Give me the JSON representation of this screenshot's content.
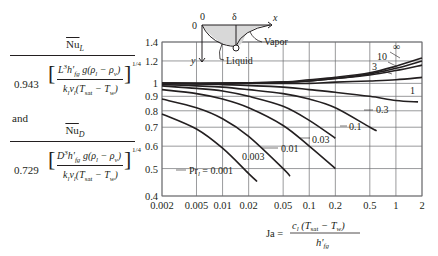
{
  "left_formulas": {
    "formula_L": {
      "numerator": "Nu_L",
      "coefficient": "0.943",
      "inner_numerator": "L³h′fg g(ρl − ρv)",
      "inner_denominator": "klνl(Tsat − Tw)",
      "exponent": "1/4"
    },
    "connector": "and",
    "formula_D": {
      "numerator": "Nu_D",
      "coefficient": "0.729",
      "inner_numerator": "D³h′fg g(ρl − ρv)",
      "inner_denominator": "klνl(Tsat − Tw)",
      "exponent": "1/4"
    }
  },
  "inset": {
    "origin_label": "0",
    "top_origin_label": "0",
    "delta_label": "δ",
    "x_label": "x",
    "y_label": "y",
    "vapor_label": "Vapor",
    "liquid_label": "Liquid"
  },
  "chart_data": {
    "type": "line",
    "title": "",
    "xlabel": "Ja = c_l (T_sat − T_w) / h′_fg",
    "ylabel": "Nu_L / [0.943 (...)^(1/4)]  and  Nu_D / [0.729 (...)^(1/4)]",
    "xscale": "log",
    "yscale": "log",
    "xlim": [
      0.002,
      2
    ],
    "ylim": [
      0.4,
      1.4
    ],
    "grid": true,
    "x_ticks": [
      "0.002",
      "0.005",
      "0.01",
      "0.02",
      "0.05",
      "0.1",
      "0.2",
      "0.5",
      "1",
      "2"
    ],
    "y_ticks": [
      "0.4",
      "0.5",
      "0.6",
      "0.7",
      "0.8",
      "0.9",
      "1",
      "1.2",
      "1.4"
    ],
    "legend_prefix": "Pr_l =",
    "series": [
      {
        "name": "0.001",
        "label": "Pr_l = 0.001",
        "x": [
          0.002,
          0.005,
          0.01,
          0.02,
          0.025
        ],
        "y": [
          0.78,
          0.69,
          0.59,
          0.48,
          0.45
        ]
      },
      {
        "name": "0.003",
        "label": "0.003",
        "x": [
          0.002,
          0.005,
          0.01,
          0.02,
          0.05,
          0.06
        ],
        "y": [
          0.88,
          0.82,
          0.75,
          0.65,
          0.5,
          0.47
        ]
      },
      {
        "name": "0.01",
        "label": "0.01",
        "x": [
          0.002,
          0.005,
          0.01,
          0.02,
          0.05,
          0.1,
          0.2
        ],
        "y": [
          0.95,
          0.92,
          0.88,
          0.82,
          0.71,
          0.6,
          0.5
        ]
      },
      {
        "name": "0.03",
        "label": "0.03",
        "x": [
          0.002,
          0.005,
          0.01,
          0.02,
          0.05,
          0.1,
          0.2
        ],
        "y": [
          0.98,
          0.96,
          0.94,
          0.9,
          0.83,
          0.74,
          0.64
        ]
      },
      {
        "name": "0.1",
        "label": "0.1",
        "x": [
          0.002,
          0.005,
          0.01,
          0.02,
          0.05,
          0.1,
          0.2,
          0.5,
          0.6
        ],
        "y": [
          0.99,
          0.98,
          0.97,
          0.95,
          0.92,
          0.88,
          0.82,
          0.7,
          0.68
        ]
      },
      {
        "name": "0.3",
        "label": "0.3",
        "x": [
          0.002,
          0.01,
          0.05,
          0.1,
          0.2,
          0.5,
          1,
          1.8
        ],
        "y": [
          1.0,
          0.99,
          0.97,
          0.95,
          0.93,
          0.9,
          0.87,
          0.86
        ]
      },
      {
        "name": "1",
        "label": "1",
        "x": [
          0.002,
          0.01,
          0.05,
          0.1,
          0.2,
          0.5,
          1,
          2
        ],
        "y": [
          1.0,
          1.0,
          1.0,
          1.0,
          1.01,
          1.02,
          1.03,
          1.05
        ]
      },
      {
        "name": "3",
        "label": "3",
        "x": [
          0.002,
          0.01,
          0.05,
          0.1,
          0.2,
          0.5,
          1,
          2
        ],
        "y": [
          1.0,
          1.0,
          1.01,
          1.02,
          1.04,
          1.07,
          1.11,
          1.16
        ]
      },
      {
        "name": "10",
        "label": "10",
        "x": [
          0.002,
          0.01,
          0.05,
          0.1,
          0.2,
          0.5,
          1,
          2
        ],
        "y": [
          1.0,
          1.0,
          1.01,
          1.02,
          1.04,
          1.08,
          1.13,
          1.2
        ]
      },
      {
        "name": "∞",
        "label": "∞",
        "x": [
          0.002,
          0.01,
          0.05,
          0.1,
          0.2,
          0.5,
          1,
          2
        ],
        "y": [
          1.0,
          1.0,
          1.01,
          1.03,
          1.05,
          1.09,
          1.15,
          1.23
        ]
      }
    ]
  }
}
